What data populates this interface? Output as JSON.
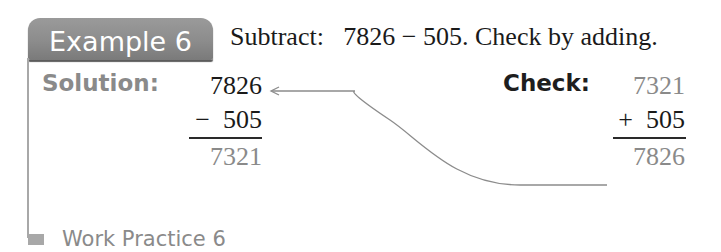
{
  "example": {
    "tab_label": "Example 6",
    "problem_text": "Subtract:   7826 − 505. Check by adding."
  },
  "solution": {
    "label": "Solution:",
    "minuend": "7826",
    "subtrahend_line": "−  505",
    "difference": "7321"
  },
  "check": {
    "label": "Check:",
    "addend1": "7321",
    "addend2_line": "+  505",
    "sum": "7826"
  },
  "work_practice": {
    "label": "Work Practice 6"
  },
  "colors": {
    "tab_background": "#8c8c8c",
    "accent_gray": "#8a8a8a",
    "text_dark": "#1a1a1a",
    "connector_line": "#8c8c8c"
  },
  "icons": {
    "connector": "curved-arrow-icon",
    "work_marker": "square-marker-icon"
  }
}
